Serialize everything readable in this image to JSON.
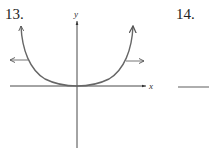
{
  "problems": [
    {
      "number": "13.",
      "graph": {
        "x_axis_label": "x",
        "y_axis_label": "y",
        "curve": "U-shaped curve with vertex at origin, opening upward, arrows at both ends",
        "horizontal_arrows": [
          "left",
          "right"
        ]
      }
    },
    {
      "number": "14.",
      "graph": {
        "partial": true
      }
    }
  ],
  "colors": {
    "axis": "#333333",
    "curve": "#666666",
    "text": "#222222"
  }
}
